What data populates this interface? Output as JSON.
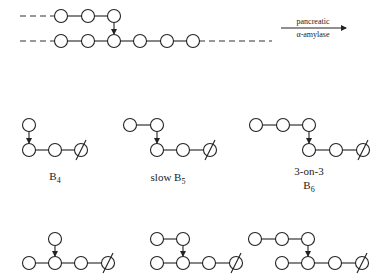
{
  "reaction": {
    "enzyme_line1": "pancreatic",
    "enzyme_line2": "α-amylase"
  },
  "substrate": {
    "top_chain": [
      {
        "x": 61,
        "y": 16
      },
      {
        "x": 88,
        "y": 16
      },
      {
        "x": 114,
        "y": 16
      }
    ],
    "bottom_chain": [
      {
        "x": 61,
        "y": 41
      },
      {
        "x": 88,
        "y": 41
      },
      {
        "x": 114,
        "y": 41
      },
      {
        "x": 140,
        "y": 41
      },
      {
        "x": 167,
        "y": 41
      },
      {
        "x": 193,
        "y": 41
      }
    ],
    "branch_from": {
      "x": 114,
      "y": 16
    },
    "branch_to": {
      "x": 114,
      "y": 41
    }
  },
  "products": [
    {
      "id": "B4",
      "label_main": "B",
      "label_sub": "4",
      "label_prefix": "",
      "label_x": 55,
      "label_y": 180,
      "top": [
        {
          "x": 29,
          "y": 125
        }
      ],
      "bottom": [
        {
          "x": 29,
          "y": 150
        },
        {
          "x": 55,
          "y": 150
        }
      ],
      "reducing_end": {
        "x": 81,
        "y": 150
      },
      "branch_from": {
        "x": 29,
        "y": 125
      },
      "branch_to": {
        "x": 29,
        "y": 150
      }
    },
    {
      "id": "B5",
      "label_main": "B",
      "label_sub": "5",
      "label_prefix": "slow ",
      "label_x": 168,
      "label_y": 180,
      "top": [
        {
          "x": 130,
          "y": 125
        },
        {
          "x": 157,
          "y": 125
        }
      ],
      "bottom": [
        {
          "x": 157,
          "y": 150
        },
        {
          "x": 183,
          "y": 150
        }
      ],
      "reducing_end": {
        "x": 210,
        "y": 150
      },
      "branch_from": {
        "x": 157,
        "y": 125
      },
      "branch_to": {
        "x": 157,
        "y": 150
      }
    },
    {
      "id": "B6",
      "label_main": "B",
      "label_sub": "6",
      "label_prefix": "",
      "label_extra": "3-on-3",
      "label_x": 309,
      "label_y": 190,
      "top": [
        {
          "x": 256,
          "y": 125
        },
        {
          "x": 283,
          "y": 125
        },
        {
          "x": 309,
          "y": 125
        }
      ],
      "bottom": [
        {
          "x": 309,
          "y": 150
        },
        {
          "x": 336,
          "y": 150
        }
      ],
      "reducing_end": {
        "x": 363,
        "y": 150
      },
      "branch_from": {
        "x": 309,
        "y": 125
      },
      "branch_to": {
        "x": 309,
        "y": 150
      }
    },
    {
      "id": "B5-alt",
      "top": [
        {
          "x": 55,
          "y": 239
        }
      ],
      "bottom": [
        {
          "x": 29,
          "y": 263
        },
        {
          "x": 55,
          "y": 263
        },
        {
          "x": 81,
          "y": 263
        }
      ],
      "reducing_end": {
        "x": 108,
        "y": 263
      },
      "branch_from": {
        "x": 55,
        "y": 239
      },
      "branch_to": {
        "x": 55,
        "y": 263
      }
    },
    {
      "id": "B6-alt",
      "top": [
        {
          "x": 157,
          "y": 239
        },
        {
          "x": 183,
          "y": 239
        }
      ],
      "bottom": [
        {
          "x": 157,
          "y": 263
        },
        {
          "x": 183,
          "y": 263
        },
        {
          "x": 209,
          "y": 263
        }
      ],
      "reducing_end": {
        "x": 236,
        "y": 263
      },
      "branch_from": {
        "x": 183,
        "y": 239
      },
      "branch_to": {
        "x": 183,
        "y": 263
      }
    },
    {
      "id": "B7-alt",
      "top": [
        {
          "x": 255,
          "y": 239
        },
        {
          "x": 282,
          "y": 239
        },
        {
          "x": 308,
          "y": 239
        }
      ],
      "bottom": [
        {
          "x": 282,
          "y": 263
        },
        {
          "x": 308,
          "y": 263
        },
        {
          "x": 335,
          "y": 263
        }
      ],
      "reducing_end": {
        "x": 362,
        "y": 263
      },
      "branch_from": {
        "x": 308,
        "y": 239
      },
      "branch_to": {
        "x": 308,
        "y": 263
      }
    }
  ]
}
